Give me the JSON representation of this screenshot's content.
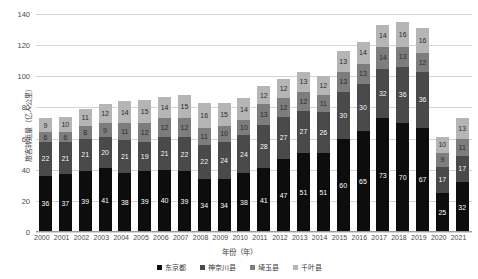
{
  "chart_data": {
    "type": "bar",
    "stacked": true,
    "title": "",
    "xlabel": "年份（年）",
    "ylabel": "旅客转运量（亿人公里）",
    "ylim": [
      0,
      140
    ],
    "ytick_step": 20,
    "yticks": [
      "0",
      "20",
      "40",
      "60",
      "80",
      "100",
      "120",
      "140"
    ],
    "grid": true,
    "legend_position": "bottom",
    "categories": [
      "2000",
      "2001",
      "2002",
      "2003",
      "2004",
      "2005",
      "2006",
      "2007",
      "2008",
      "2009",
      "2010",
      "2011",
      "2012",
      "2013",
      "2014",
      "2015",
      "2016",
      "2017",
      "2018",
      "2019",
      "2020",
      "2021"
    ],
    "series": [
      {
        "name": "东京都",
        "color": "#0d0d0d",
        "values": [
          36,
          37,
          39,
          41,
          38,
          39,
          40,
          39,
          34,
          34,
          38,
          41,
          47,
          51,
          51,
          60,
          65,
          73,
          70,
          67,
          25,
          32
        ]
      },
      {
        "name": "神奈川县",
        "color": "#4a4a4a",
        "values": [
          22,
          21,
          21,
          20,
          21,
          19,
          21,
          22,
          22,
          24,
          24,
          28,
          27,
          27,
          26,
          30,
          30,
          32,
          36,
          36,
          17,
          17
        ]
      },
      {
        "name": "埼玉县",
        "color": "#7d7d7d",
        "values": [
          6,
          6,
          8,
          9,
          11,
          12,
          12,
          12,
          11,
          10,
          10,
          13,
          12,
          12,
          11,
          13,
          13,
          14,
          13,
          12,
          9,
          11
        ]
      },
      {
        "name": "千叶县",
        "color": "#b5b5b5",
        "values": [
          9,
          10,
          11,
          12,
          14,
          15,
          14,
          15,
          16,
          15,
          14,
          12,
          12,
          13,
          12,
          13,
          14,
          14,
          16,
          16,
          10,
          13
        ]
      }
    ],
    "totals": [
      73,
      74,
      79,
      82,
      84,
      85,
      87,
      88,
      83,
      83,
      86,
      94,
      98,
      103,
      100,
      116,
      122,
      133,
      135,
      131,
      61,
      73
    ]
  }
}
